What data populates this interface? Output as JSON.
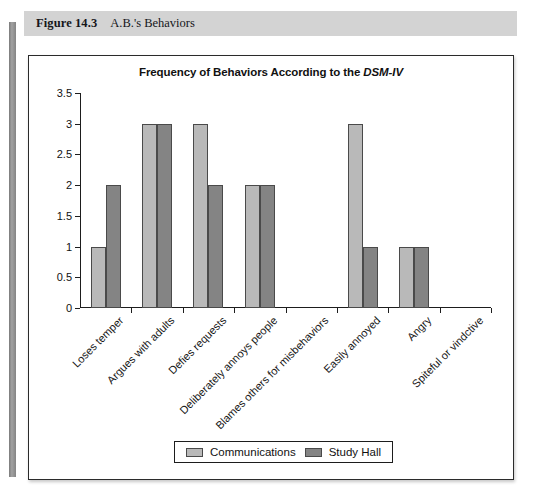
{
  "figure": {
    "number": "Figure 14.3",
    "caption": "A.B.'s Behaviors"
  },
  "chart_data": {
    "type": "bar",
    "title": "Frequency of Behaviors According to the DSM-IV",
    "title_plain": "Frequency of Behaviors According to the ",
    "title_italic": "DSM-IV",
    "xlabel": "",
    "ylabel": "",
    "ylim": [
      0,
      3.5
    ],
    "yticks": [
      "0",
      "0.5",
      "1",
      "1.5",
      "2",
      "2.5",
      "3",
      "3.5"
    ],
    "ytick_values": [
      0,
      0.5,
      1,
      1.5,
      2,
      2.5,
      3,
      3.5
    ],
    "grid": false,
    "legend_position": "bottom-center",
    "categories": [
      "Loses temper",
      "Argues with adults",
      "Defies requests",
      "Deliberately annoys people",
      "Blames others for misbehaviors",
      "Easily annoyed",
      "Angry",
      "Spiteful or vindctive"
    ],
    "series": [
      {
        "name": "Communications",
        "color": "#b9b9b9",
        "values": [
          1,
          3,
          3,
          2,
          0,
          3,
          1,
          0
        ]
      },
      {
        "name": "Study Hall",
        "color": "#848484",
        "values": [
          2,
          3,
          2,
          2,
          0,
          1,
          1,
          0
        ]
      }
    ]
  }
}
